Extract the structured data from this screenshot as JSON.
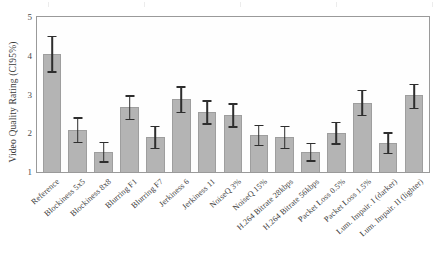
{
  "chart_data": {
    "type": "bar",
    "title": "",
    "subtitle": "",
    "xlabel": "",
    "ylabel": "Video Quality Rating (CI95%)",
    "ylim": [
      1,
      5
    ],
    "yticks": [
      "5",
      "4",
      "3",
      "2",
      "1"
    ],
    "grid": false,
    "legend": null,
    "error_bars": "CI95%",
    "bar_color": "#b4b4b4",
    "bar_edge_color": "#9e9e9e",
    "error_bar_color": "#2e2e2e",
    "axis_color": "#9a9a9a",
    "categories": [
      "Reference",
      "Blockiness 5x5",
      "Blockiness 8x8",
      "Blurring F1",
      "Blurring F7",
      "Jerkiness 6",
      "Jerkiness 11",
      "NoiseQ 3%",
      "NoiseQ 15%",
      "H.264 Bitrate 28kbps",
      "H.264 Bitrate 56kbps",
      "Packet Loss 0.5%",
      "Packet Loss 1.5%",
      "Lum. Impair. I (darker)",
      "Lum. Impair. II (lighter)"
    ],
    "values": [
      4.05,
      2.08,
      1.51,
      2.67,
      1.9,
      2.88,
      2.54,
      2.46,
      1.95,
      1.9,
      1.51,
      2.0,
      2.79,
      1.74,
      2.98
    ],
    "ci_low": [
      3.6,
      1.78,
      1.28,
      2.38,
      1.63,
      2.56,
      2.26,
      2.18,
      1.7,
      1.63,
      1.3,
      1.74,
      2.48,
      1.5,
      2.66
    ],
    "ci_high": [
      4.52,
      2.41,
      1.78,
      2.98,
      2.2,
      3.22,
      2.85,
      2.78,
      2.22,
      2.2,
      1.76,
      2.3,
      3.12,
      2.02,
      3.28
    ]
  },
  "chart_meta": {
    "width": 447,
    "height": 271
  }
}
